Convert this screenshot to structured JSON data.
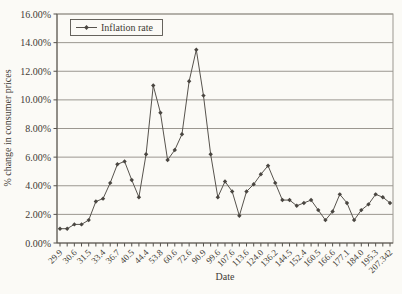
{
  "figure": {
    "background_color": "#fbfaf6",
    "text_color": "#3f3b35"
  },
  "chart_data": {
    "type": "line",
    "title": "",
    "xlabel": "Date",
    "ylabel": "% change in consumer prices",
    "legend": [
      "Inflation rate"
    ],
    "legend_position": "top-left-inside",
    "marker": "diamond",
    "grid": "horizontal",
    "ylim": [
      0,
      16
    ],
    "y_grid_step": 2,
    "y_tick_labels": [
      "0.00%",
      "2.00%",
      "4.00%",
      "6.00%",
      "8.00%",
      "10.00%",
      "12.00%",
      "14.00%",
      "16.00%"
    ],
    "x_tick_labels": [
      "29.9",
      "30.6",
      "31.5",
      "33.4",
      "36.7",
      "40.5",
      "44.4",
      "53.8",
      "60.6",
      "72.6",
      "90.9",
      "99.6",
      "107.6",
      "113.6",
      "124.0",
      "136.2",
      "144.5",
      "152.4",
      "160.5",
      "166.6",
      "177.1",
      "184.0",
      "195.3",
      "207.342"
    ],
    "x_label_every_nth_point": 2,
    "values": [
      1.0,
      1.0,
      1.3,
      1.3,
      1.6,
      2.9,
      3.1,
      4.2,
      5.5,
      5.7,
      4.4,
      3.2,
      6.2,
      11.0,
      9.1,
      5.8,
      6.5,
      7.6,
      11.3,
      13.5,
      10.3,
      6.2,
      3.2,
      4.3,
      3.6,
      1.9,
      3.6,
      4.1,
      4.8,
      5.4,
      4.2,
      3.0,
      3.0,
      2.6,
      2.8,
      3.0,
      2.3,
      1.6,
      2.2,
      3.4,
      2.8,
      1.6,
      2.3,
      2.7,
      3.4,
      3.2,
      2.8
    ],
    "colors": {
      "line": "#57534d",
      "marker": "#4a4641",
      "grid": "#9b9790",
      "axis": "#57534d",
      "text": "#3f3b35",
      "background": "#fbfaf6",
      "legend_border": "#57534d"
    }
  }
}
